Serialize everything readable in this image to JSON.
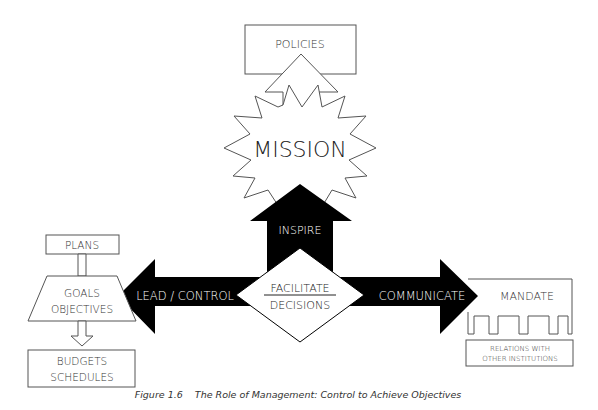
{
  "diagram": {
    "top": {
      "policies": "POLICIES",
      "mission": "MISSION",
      "inspire": "INSPIRE"
    },
    "center": {
      "line1": "FACILITATE",
      "line2": "DECISIONS"
    },
    "left": {
      "arrow": "LEAD / CONTROL",
      "plans": "PLANS",
      "goals1": "GOALS",
      "goals2": "OBJECTIVES",
      "budgets1": "BUDGETS",
      "budgets2": "SCHEDULES"
    },
    "right": {
      "arrow": "COMMUNICATE",
      "mandate": "MANDATE",
      "relations1": "RELATIONS WITH",
      "relations2": "OTHER INSTITUTIONS"
    }
  },
  "caption": "Figure 1.6    The Role of Management: Control to Achieve Objectives"
}
